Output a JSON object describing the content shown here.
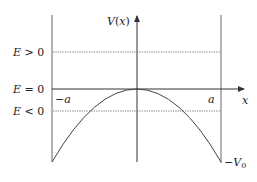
{
  "diagram": {
    "type": "potential-well-plot",
    "axes": {
      "y_label": "V(x)",
      "x_label": "x"
    },
    "energy_levels": [
      {
        "label": "E > 0",
        "style": "dotted"
      },
      {
        "label": "E = 0",
        "style": "solid"
      },
      {
        "label": "E < 0",
        "style": "dotted"
      }
    ],
    "markers": {
      "left": "−a",
      "right": "a",
      "bottom": "−V",
      "bottom_sub": "0"
    },
    "curve": "inverted parabola with maximum 0 at x=0, reaching −V0 at x=±a",
    "colors": {
      "line": "#555555",
      "curve": "#444444"
    }
  }
}
